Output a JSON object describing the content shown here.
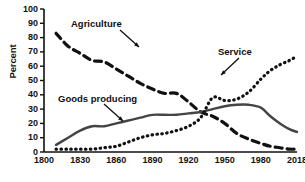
{
  "chart_data": {
    "type": "line",
    "title": "",
    "subtitle": "",
    "xlabel": "",
    "ylabel": "Percent",
    "xlim": [
      1800,
      2018
    ],
    "ylim": [
      0,
      100
    ],
    "grid": false,
    "legend_position": "inline-annotations",
    "xticks": [
      "1800",
      "1830",
      "1860",
      "1890",
      "1920",
      "1950",
      "1980",
      "2018"
    ],
    "yticks": [
      "0",
      "10",
      "20",
      "30",
      "40",
      "50",
      "60",
      "70",
      "80",
      "90",
      "100"
    ],
    "annotations": [
      {
        "label": "Agriculture",
        "target_x": 1838,
        "target_y": 70
      },
      {
        "label": "Goods producing",
        "target_x": 1872,
        "target_y": 25
      },
      {
        "label": "Service",
        "target_x": 1984,
        "target_y": 50
      }
    ],
    "series": [
      {
        "name": "Agriculture",
        "style": "dashed",
        "color": "#111111",
        "x": [
          1810,
          1820,
          1830,
          1840,
          1850,
          1860,
          1870,
          1880,
          1890,
          1900,
          1910,
          1920,
          1930,
          1940,
          1950,
          1960,
          1970,
          1980,
          1990,
          2000,
          2010,
          2018
        ],
        "values": [
          83,
          74,
          69,
          64,
          63,
          58,
          53,
          48,
          44,
          41,
          41,
          35,
          28,
          25,
          20,
          13,
          9,
          6,
          4,
          3,
          2,
          2
        ]
      },
      {
        "name": "Goods producing",
        "style": "solid",
        "color": "#444444",
        "x": [
          1810,
          1820,
          1830,
          1840,
          1850,
          1860,
          1870,
          1880,
          1890,
          1900,
          1910,
          1920,
          1930,
          1940,
          1950,
          1960,
          1970,
          1980,
          1990,
          2000,
          2010,
          2018
        ],
        "values": [
          5,
          10,
          15,
          18,
          18,
          20,
          22,
          24,
          26,
          26,
          26,
          27,
          28,
          30,
          32,
          33,
          33,
          31,
          25,
          20,
          16,
          14
        ]
      },
      {
        "name": "Service",
        "style": "dotted",
        "color": "#111111",
        "x": [
          1810,
          1820,
          1830,
          1840,
          1850,
          1860,
          1870,
          1880,
          1890,
          1900,
          1910,
          1920,
          1930,
          1940,
          1950,
          1960,
          1970,
          1980,
          1990,
          2000,
          2010,
          2018
        ],
        "values": [
          2,
          2,
          2,
          2,
          3,
          4,
          7,
          10,
          12,
          13,
          15,
          18,
          24,
          38,
          36,
          37,
          42,
          51,
          57,
          61,
          64,
          67
        ]
      }
    ]
  }
}
